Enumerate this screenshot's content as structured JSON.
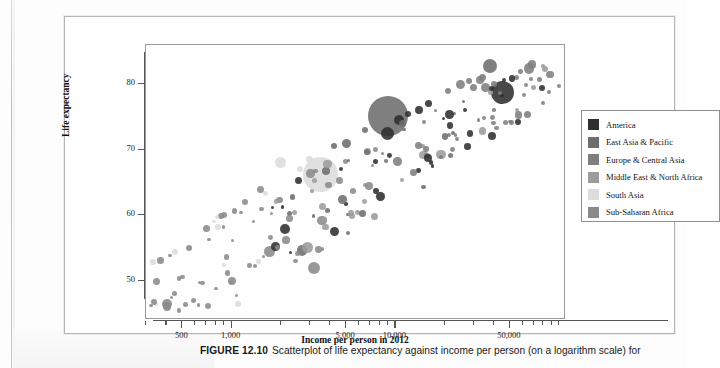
{
  "figure": {
    "caption_label": "FIGURE 12.10",
    "caption_text": "Scatterplot of life expectancy against income per person (on a logarithm scale) for"
  },
  "axes": {
    "x_title": "Income per person in 2012",
    "y_title": "Life expectancy",
    "x_ticks": [
      "500",
      "1,000",
      "5,000",
      "10,000",
      "50,000"
    ],
    "y_ticks": [
      "80",
      "70",
      "60",
      "50"
    ]
  },
  "legend": {
    "items": [
      {
        "label": "America",
        "color": "#2f2f2f"
      },
      {
        "label": "East Asia & Pacific",
        "color": "#6d6d6d"
      },
      {
        "label": "Europe & Central Asia",
        "color": "#7e7e7e"
      },
      {
        "label": "Middle East & North Africa",
        "color": "#9c9c9c"
      },
      {
        "label": "South Asia",
        "color": "#dcdcdc"
      },
      {
        "label": "Sub-Saharan Africa",
        "color": "#8a8a8a"
      }
    ]
  },
  "chart_data": {
    "type": "scatter",
    "title": "Scatterplot of life expectancy against income per person (on a logarithm scale)",
    "xlabel": "Income per person in 2012",
    "ylabel": "Life expectancy",
    "xscale": "log",
    "xlim": [
      300,
      110000
    ],
    "ylim": [
      44,
      86
    ],
    "xticks": [
      500,
      1000,
      5000,
      10000,
      50000
    ],
    "yticks": [
      50,
      60,
      70,
      80
    ],
    "grid": false,
    "legend_position": "right-outside",
    "bubble_size_encodes": "population",
    "series": [
      {
        "name": "America",
        "color": "#2f2f2f"
      },
      {
        "name": "East Asia & Pacific",
        "color": "#6d6d6d"
      },
      {
        "name": "Europe & Central Asia",
        "color": "#7e7e7e"
      },
      {
        "name": "Middle East & North Africa",
        "color": "#9c9c9c"
      },
      {
        "name": "South Asia",
        "color": "#dcdcdc"
      },
      {
        "name": "Sub-Saharan Africa",
        "color": "#8a8a8a"
      }
    ],
    "points": [
      {
        "x": 45000,
        "y": 78.8,
        "r": 11.5,
        "g": "America"
      },
      {
        "x": 9000,
        "y": 75.2,
        "r": 20.0,
        "g": "East Asia & Pacific"
      },
      {
        "x": 3500,
        "y": 66.2,
        "r": 17.5,
        "g": "South Asia"
      },
      {
        "x": 9500,
        "y": 73.5,
        "r": 7.5,
        "g": "Europe & Central Asia"
      },
      {
        "x": 9000,
        "y": 72.5,
        "r": 6.5,
        "g": "America"
      },
      {
        "x": 10500,
        "y": 74.5,
        "r": 5.0,
        "g": "America"
      },
      {
        "x": 38000,
        "y": 82.8,
        "r": 7.0,
        "g": "East Asia & Pacific"
      },
      {
        "x": 33000,
        "y": 80.6,
        "r": 4.0,
        "g": "Europe & Central Asia"
      },
      {
        "x": 34000,
        "y": 81.0,
        "r": 3.5,
        "g": "Europe & Central Asia"
      },
      {
        "x": 25000,
        "y": 80.0,
        "r": 4.5,
        "g": "Europe & Central Asia"
      },
      {
        "x": 28000,
        "y": 80.5,
        "r": 3.0,
        "g": "Europe & Central Asia"
      },
      {
        "x": 21000,
        "y": 79.0,
        "r": 3.0,
        "g": "Europe & Central Asia"
      },
      {
        "x": 30000,
        "y": 79.5,
        "r": 3.5,
        "g": "Europe & Central Asia"
      },
      {
        "x": 40000,
        "y": 80.0,
        "r": 3.0,
        "g": "Europe & Central Asia"
      },
      {
        "x": 55000,
        "y": 81.0,
        "r": 2.5,
        "g": "Europe & Central Asia"
      },
      {
        "x": 70000,
        "y": 79.5,
        "r": 2.5,
        "g": "Middle East & North Africa"
      },
      {
        "x": 16000,
        "y": 77.0,
        "r": 3.5,
        "g": "America"
      },
      {
        "x": 14000,
        "y": 76.0,
        "r": 4.0,
        "g": "America"
      },
      {
        "x": 12000,
        "y": 75.5,
        "r": 3.0,
        "g": "America"
      },
      {
        "x": 11000,
        "y": 74.0,
        "r": 3.5,
        "g": "East Asia & Pacific"
      },
      {
        "x": 6500,
        "y": 73.0,
        "r": 3.0,
        "g": "East Asia & Pacific"
      },
      {
        "x": 5000,
        "y": 71.0,
        "r": 4.5,
        "g": "East Asia & Pacific"
      },
      {
        "x": 4200,
        "y": 70.5,
        "r": 3.0,
        "g": "East Asia & Pacific"
      },
      {
        "x": 3000,
        "y": 68.5,
        "r": 3.5,
        "g": "South Asia"
      },
      {
        "x": 2600,
        "y": 67.0,
        "r": 3.0,
        "g": "South Asia"
      },
      {
        "x": 2000,
        "y": 68.0,
        "r": 5.5,
        "g": "South Asia"
      },
      {
        "x": 1500,
        "y": 64.0,
        "r": 3.5,
        "g": "Sub-Saharan Africa"
      },
      {
        "x": 1200,
        "y": 62.0,
        "r": 3.0,
        "g": "Sub-Saharan Africa"
      },
      {
        "x": 900,
        "y": 60.0,
        "r": 3.0,
        "g": "Sub-Saharan Africa"
      },
      {
        "x": 700,
        "y": 58.0,
        "r": 3.5,
        "g": "Sub-Saharan Africa"
      },
      {
        "x": 550,
        "y": 55.0,
        "r": 3.0,
        "g": "Sub-Saharan Africa"
      },
      {
        "x": 450,
        "y": 48.0,
        "r": 2.5,
        "g": "Sub-Saharan Africa"
      },
      {
        "x": 1700,
        "y": 54.5,
        "r": 5.5,
        "g": "Sub-Saharan Africa"
      },
      {
        "x": 3200,
        "y": 52.0,
        "r": 6.0,
        "g": "Sub-Saharan Africa"
      },
      {
        "x": 1000,
        "y": 50.0,
        "r": 4.0,
        "g": "Sub-Saharan Africa"
      }
    ]
  }
}
